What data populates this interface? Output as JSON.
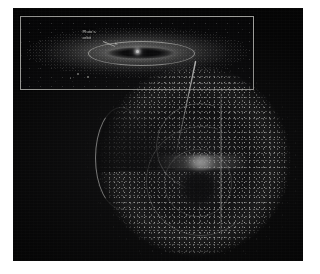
{
  "figure": {
    "background_color": "#050505",
    "page_color": "#ffffff",
    "caption": "",
    "alt_description": "Astronomical illustration of the Oort Cloud shown as a spherical swarm of comets with a cutaway wedge, plus an inset showing the flattened Kuiper Belt disk seen edge-on."
  },
  "inset": {
    "border_color": "#b9b9b4",
    "background_color": "#060607",
    "label": "Pluto's\norbit",
    "label_text": "Pluto's orbit",
    "elements": {
      "outer_disk_name": "kuiper-belt-disk",
      "inner_lens_name": "inner-solar-system-lens",
      "sun_point_name": "sun-point",
      "orbit_ellipse_name": "pluto-orbit-ellipse",
      "leader_arrow_name": "label-leader-arrow"
    },
    "stray_object_count": 3
  },
  "main": {
    "object_name": "oort-cloud-sphere",
    "cutaway_label": "",
    "features": {
      "sphere": "oort-cloud-dot-shell",
      "core": "inner-solar-system-core",
      "void": "inner-cavity",
      "streak": "comet-trajectory-streak",
      "crescent": "left-limb-crescent",
      "shells": [
        "interior-shell-a",
        "interior-shell-b",
        "interior-shell-c"
      ]
    }
  },
  "colors": {
    "dot_bright": "#ecece7",
    "dot_mid": "#cecec9",
    "dot_dim": "#969694",
    "core_white": "#fffffc",
    "inset_border": "#b9b9b4",
    "plate_black": "#050505"
  }
}
